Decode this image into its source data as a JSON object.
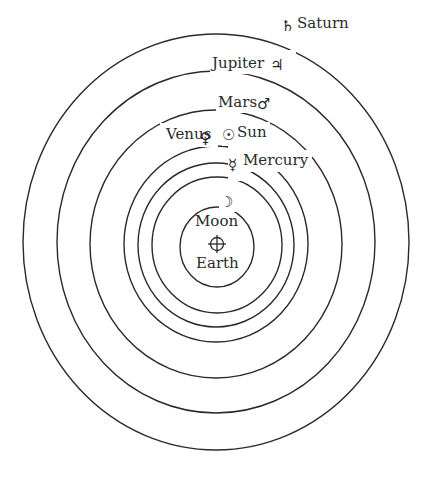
{
  "diagram": {
    "center": {
      "x": 216,
      "y": 243
    },
    "orbits": [
      {
        "name": "Saturn",
        "rx": 193,
        "ry": 208
      },
      {
        "name": "Jupiter",
        "rx": 159,
        "ry": 171
      },
      {
        "name": "Mars",
        "rx": 126,
        "ry": 134
      },
      {
        "name": "Sun",
        "rx": 92,
        "ry": 98
      },
      {
        "name": "Venus",
        "rx": 78,
        "ry": 82
      },
      {
        "name": "Mercury",
        "rx": 65,
        "ry": 68
      },
      {
        "name": "Moon",
        "rx": 37,
        "ry": 40
      }
    ],
    "labels": {
      "saturn": "Saturn",
      "jupiter": "Jupiter",
      "mars": "Mars",
      "sun": "Sun",
      "venus": "Venus",
      "mercury": "Mercury",
      "moon": "Moon",
      "earth": "Earth"
    },
    "symbols": {
      "saturn": "♄",
      "jupiter": "♃",
      "mars": "♂",
      "sun": "☉",
      "venus": "♀",
      "mercury": "☿",
      "moon": "☽",
      "earth": "⊕"
    },
    "colors": {
      "stroke": "#2a2a2a",
      "background": "#ffffff"
    }
  }
}
